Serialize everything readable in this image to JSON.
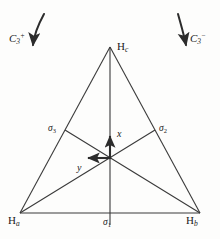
{
  "figure": {
    "name": "c3v-symmetry-triangle-diagram",
    "background_color": "#fdfdfc",
    "line_color": "#3a3a3a",
    "text_color": "#1a1a1a"
  },
  "vertices": {
    "top": {
      "element": "H",
      "sub": "c",
      "x": 110,
      "y": 47
    },
    "bottom_left": {
      "element": "H",
      "sub": "a",
      "x": 20,
      "y": 213
    },
    "bottom_right": {
      "element": "H",
      "sub": "b",
      "x": 200,
      "y": 213
    }
  },
  "mirror_planes": [
    {
      "id": "sigma-1",
      "symbol": "σ",
      "sub": "1",
      "position": "bottom-center"
    },
    {
      "id": "sigma-2",
      "symbol": "σ",
      "sub": "2",
      "position": "right-edge-midpoint"
    },
    {
      "id": "sigma-3",
      "symbol": "σ",
      "sub": "3",
      "position": "left-edge-midpoint"
    }
  ],
  "axes": [
    {
      "id": "x-axis",
      "label": "x",
      "direction": "up"
    },
    {
      "id": "y-axis",
      "label": "y",
      "direction": "left"
    }
  ],
  "rotations": [
    {
      "id": "c3-plus",
      "symbol": "C",
      "sub": "3",
      "sup": "+",
      "side": "left"
    },
    {
      "id": "c3-minus",
      "symbol": "C",
      "sub": "3",
      "sup": "−",
      "side": "right"
    }
  ],
  "labels": {
    "h_c": "H",
    "h_c_sub": "c",
    "h_a": "H",
    "h_a_sub": "a",
    "h_b": "H",
    "h_b_sub": "b",
    "sigma": "σ",
    "sigma1_sub": "1",
    "sigma2_sub": "2",
    "sigma3_sub": "3",
    "x": "x",
    "y": "y",
    "c": "C",
    "c3_sub": "3",
    "plus_sup": "+",
    "minus_sup": "−"
  }
}
